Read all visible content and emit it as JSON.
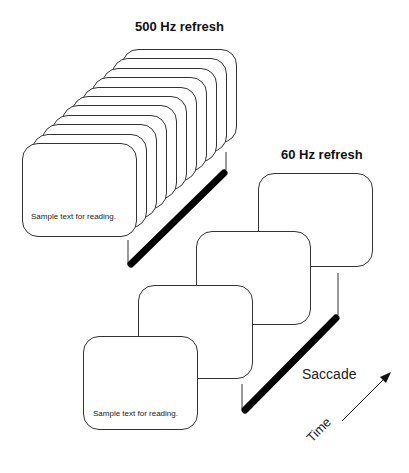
{
  "diagram": {
    "fast": {
      "title": "500 Hz refresh",
      "frame_count": 11,
      "front_text": "Sample text for reading."
    },
    "slow": {
      "title": "60 Hz refresh",
      "frame_count": 4,
      "frames": [
        {
          "text": "Sample text for reading."
        },
        {
          "text": "r reading."
        },
        {
          "text": "for reading."
        },
        {
          "text": "for reading."
        }
      ]
    },
    "saccade_label": "Saccade",
    "time_label": "Time",
    "colors": {
      "stroke": "#333333",
      "bar": "#000000",
      "background": "#ffffff"
    }
  }
}
